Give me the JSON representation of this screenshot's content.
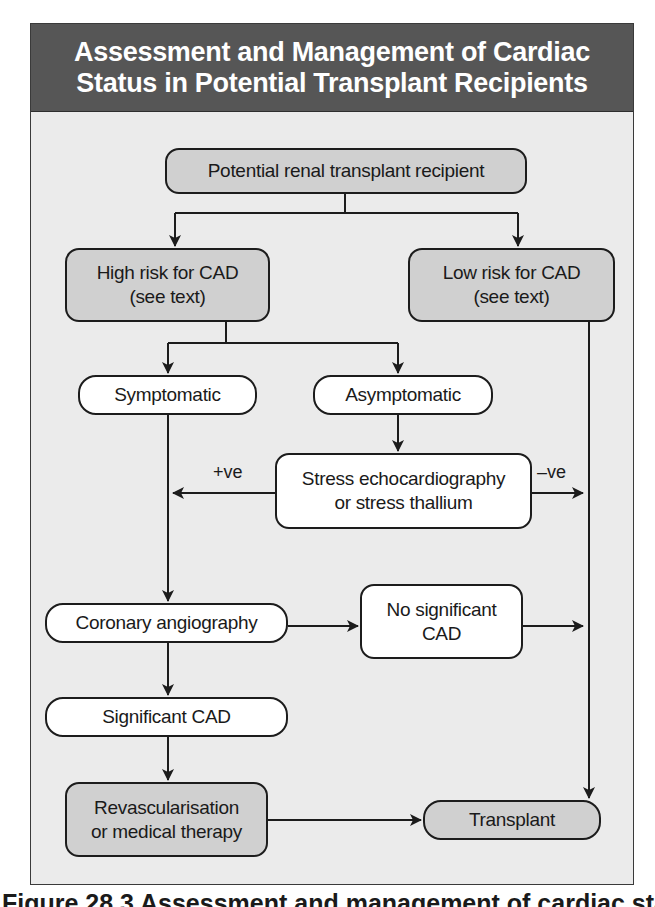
{
  "figure": {
    "title_line1": "Assessment and Management of Cardiac",
    "title_line2": "Status in Potential Transplant Recipients",
    "caption": "Figure 28.3 Assessment and management of cardiac status"
  },
  "colors": {
    "title_band": "#565656",
    "body_background": "#ebebeb",
    "shaded_node": "#d0d0d0",
    "plain_node": "#ffffff",
    "stroke": "#1c1c1c"
  },
  "nodes": {
    "start": {
      "line1": "Potential renal transplant recipient"
    },
    "high_risk": {
      "line1": "High risk for CAD",
      "line2": "(see text)"
    },
    "low_risk": {
      "line1": "Low risk for CAD",
      "line2": "(see text)"
    },
    "symptomatic": {
      "line1": "Symptomatic"
    },
    "asymptomatic": {
      "line1": "Asymptomatic"
    },
    "stress_test": {
      "line1": "Stress echocardiography",
      "line2": "or stress thallium"
    },
    "angiography": {
      "line1": "Coronary angiography"
    },
    "no_sig_cad": {
      "line1": "No significant",
      "line2": "CAD"
    },
    "sig_cad": {
      "line1": "Significant CAD"
    },
    "revasc": {
      "line1": "Revascularisation",
      "line2": "or medical therapy"
    },
    "transplant": {
      "line1": "Transplant"
    }
  },
  "edge_labels": {
    "positive": "+ve",
    "negative": "–ve"
  }
}
